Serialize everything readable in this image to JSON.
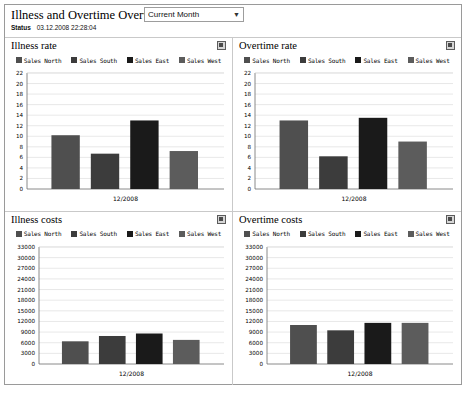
{
  "header": {
    "title": "Illness and Overtime Overview",
    "period_selector": {
      "value": "Current Month",
      "chevron": "chevron-down-icon"
    },
    "status_label": "Status",
    "status_value": "03.12.2008 22:28:04"
  },
  "series_colors": {
    "Sales North": "#4f4f4f",
    "Sales South": "#3c3c3c",
    "Sales East": "#1a1a1a",
    "Sales West": "#5c5c5c"
  },
  "panels": [
    {
      "title": "Illness rate",
      "icon": "maximize-icon"
    },
    {
      "title": "Overtime rate",
      "icon": "maximize-icon"
    },
    {
      "title": "Illness costs",
      "icon": "maximize-icon"
    },
    {
      "title": "Overtime costs",
      "icon": "maximize-icon"
    }
  ],
  "chart_data": [
    {
      "type": "bar",
      "title": "Illness rate",
      "categories": [
        "12/2008"
      ],
      "xlabel": "",
      "ylabel": "",
      "ylim": [
        0,
        22
      ],
      "yticks": [
        0,
        2,
        4,
        6,
        8,
        10,
        12,
        14,
        16,
        18,
        20,
        22
      ],
      "ytick_labels": [
        "0",
        "2",
        "4",
        "6",
        "8",
        "10",
        "12",
        "14",
        "16",
        "18",
        "20",
        "22"
      ],
      "xtick_labels": [
        "12/2008"
      ],
      "grid": true,
      "legend": "top-center",
      "series": [
        {
          "name": "Sales North",
          "values": [
            10.2
          ]
        },
        {
          "name": "Sales South",
          "values": [
            6.7
          ]
        },
        {
          "name": "Sales East",
          "values": [
            13.0
          ]
        },
        {
          "name": "Sales West",
          "values": [
            7.2
          ]
        }
      ]
    },
    {
      "type": "bar",
      "title": "Overtime rate",
      "categories": [
        "12/2008"
      ],
      "xlabel": "",
      "ylabel": "",
      "ylim": [
        0,
        22
      ],
      "yticks": [
        0,
        2,
        4,
        6,
        8,
        10,
        12,
        14,
        16,
        18,
        20,
        22
      ],
      "ytick_labels": [
        "0",
        "2",
        "4",
        "6",
        "8",
        "10",
        "12",
        "14",
        "16",
        "18",
        "20",
        "22"
      ],
      "xtick_labels": [
        "12/2008"
      ],
      "grid": true,
      "legend": "top-center",
      "series": [
        {
          "name": "Sales North",
          "values": [
            13.0
          ]
        },
        {
          "name": "Sales South",
          "values": [
            6.2
          ]
        },
        {
          "name": "Sales East",
          "values": [
            13.5
          ]
        },
        {
          "name": "Sales West",
          "values": [
            9.0
          ]
        }
      ]
    },
    {
      "type": "bar",
      "title": "Illness costs",
      "categories": [
        "12/2008"
      ],
      "xlabel": "",
      "ylabel": "",
      "ylim": [
        0,
        33000
      ],
      "yticks": [
        0,
        3000,
        6000,
        9000,
        12000,
        15000,
        18000,
        21000,
        24000,
        27000,
        30000,
        33000
      ],
      "ytick_labels": [
        "0",
        "3000",
        "6000",
        "9000",
        "12000",
        "15000",
        "18000",
        "21000",
        "24000",
        "27000",
        "30000",
        "33000"
      ],
      "xtick_labels": [
        "12/2008"
      ],
      "grid": true,
      "legend": "top-center",
      "series": [
        {
          "name": "Sales North",
          "values": [
            6400
          ]
        },
        {
          "name": "Sales South",
          "values": [
            7900
          ]
        },
        {
          "name": "Sales East",
          "values": [
            8600
          ]
        },
        {
          "name": "Sales West",
          "values": [
            6800
          ]
        }
      ]
    },
    {
      "type": "bar",
      "title": "Overtime costs",
      "categories": [
        "12/2008"
      ],
      "xlabel": "",
      "ylabel": "",
      "ylim": [
        0,
        33000
      ],
      "yticks": [
        0,
        3000,
        6000,
        9000,
        12000,
        15000,
        18000,
        21000,
        24000,
        27000,
        30000,
        33000
      ],
      "ytick_labels": [
        "0",
        "3000",
        "6000",
        "9000",
        "12000",
        "15000",
        "18000",
        "21000",
        "24000",
        "27000",
        "30000",
        "33000"
      ],
      "xtick_labels": [
        "12/2008"
      ],
      "grid": true,
      "legend": "top-center",
      "series": [
        {
          "name": "Sales North",
          "values": [
            11000
          ]
        },
        {
          "name": "Sales South",
          "values": [
            9500
          ]
        },
        {
          "name": "Sales East",
          "values": [
            11600
          ]
        },
        {
          "name": "Sales West",
          "values": [
            11600
          ]
        }
      ]
    }
  ]
}
